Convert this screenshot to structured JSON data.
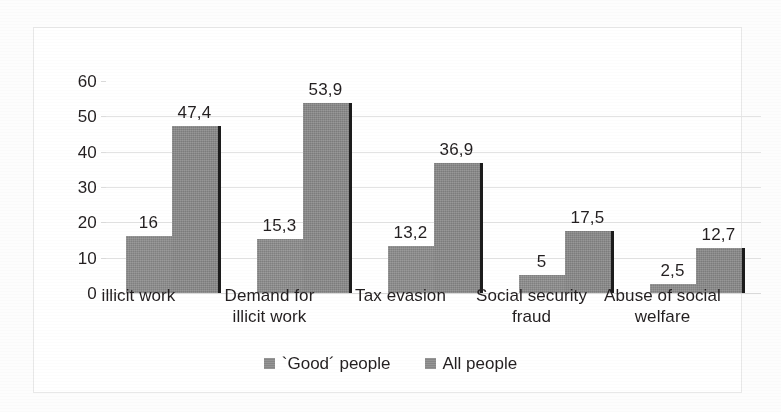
{
  "chart_data": {
    "type": "bar",
    "title": "",
    "xlabel": "",
    "ylabel": "",
    "ylim": [
      0,
      60
    ],
    "ytick_values": [
      0,
      10,
      20,
      30,
      40,
      50,
      60
    ],
    "ytick_labels": [
      "0",
      "10",
      "20",
      "30",
      "40",
      "50",
      "60"
    ],
    "grid": true,
    "legend_position": "bottom",
    "categories": [
      "illicit work",
      "Demand for\nillicit work",
      "Tax evasion",
      "Social security\nfraud",
      "Abuse of social\nwelfare"
    ],
    "series": [
      {
        "name": "`Good´ people",
        "color": "#8d8d8d",
        "values": [
          16,
          15.3,
          13.2,
          5,
          2.5
        ],
        "value_labels": [
          "16",
          "15,3",
          "13,2",
          "5",
          "2,5"
        ]
      },
      {
        "name": "All people",
        "color": "#898989",
        "values": [
          47.4,
          53.9,
          36.9,
          17.5,
          12.7
        ],
        "value_labels": [
          "47,4",
          "53,9",
          "36,9",
          "17,5",
          "12,7"
        ]
      }
    ]
  },
  "legend": {
    "items": [
      {
        "label": "`Good´ people"
      },
      {
        "label": "All people"
      }
    ]
  }
}
